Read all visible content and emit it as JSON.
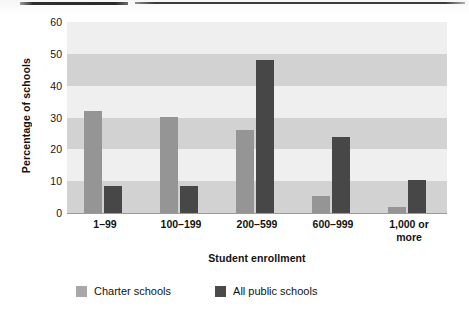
{
  "chart_data": {
    "type": "bar",
    "title": "",
    "subtitle": "",
    "xlabel": "Student enrollment",
    "ylabel": "Percentage of schools",
    "ylim": [
      0,
      60
    ],
    "yticks": [
      0,
      10,
      20,
      30,
      40,
      50,
      60
    ],
    "ytick_labels": [
      "0",
      "10",
      "20",
      "30",
      "40",
      "50",
      "60"
    ],
    "grid": "alternating horizontal bands every 10 percentage points",
    "legend_position": "bottom",
    "categories": [
      "1–99",
      "100–199",
      "200–599",
      "600–999",
      "1,000 or more"
    ],
    "category_lines": [
      [
        "1–99"
      ],
      [
        "100–199"
      ],
      [
        "200–599"
      ],
      [
        "600–999"
      ],
      [
        "1,000 or",
        "more"
      ]
    ],
    "series": [
      {
        "name": "Charter schools",
        "color": "#959595",
        "values": [
          32.0,
          30.3,
          26.0,
          5.5,
          2.0
        ]
      },
      {
        "name": "All public schools",
        "color": "#474747",
        "values": [
          8.5,
          8.5,
          48.0,
          23.8,
          10.5
        ]
      }
    ]
  },
  "legend": {
    "items": [
      {
        "label": "Charter schools",
        "color": "#a8a8a8"
      },
      {
        "label": "All public schools",
        "color": "#4a4a4a"
      }
    ]
  },
  "colors": {
    "charter": "#959595",
    "public": "#474747",
    "band_dark": "#d2d2d2",
    "band_light": "#efefef",
    "axis": "#9b9b9b",
    "text": "#131313"
  }
}
